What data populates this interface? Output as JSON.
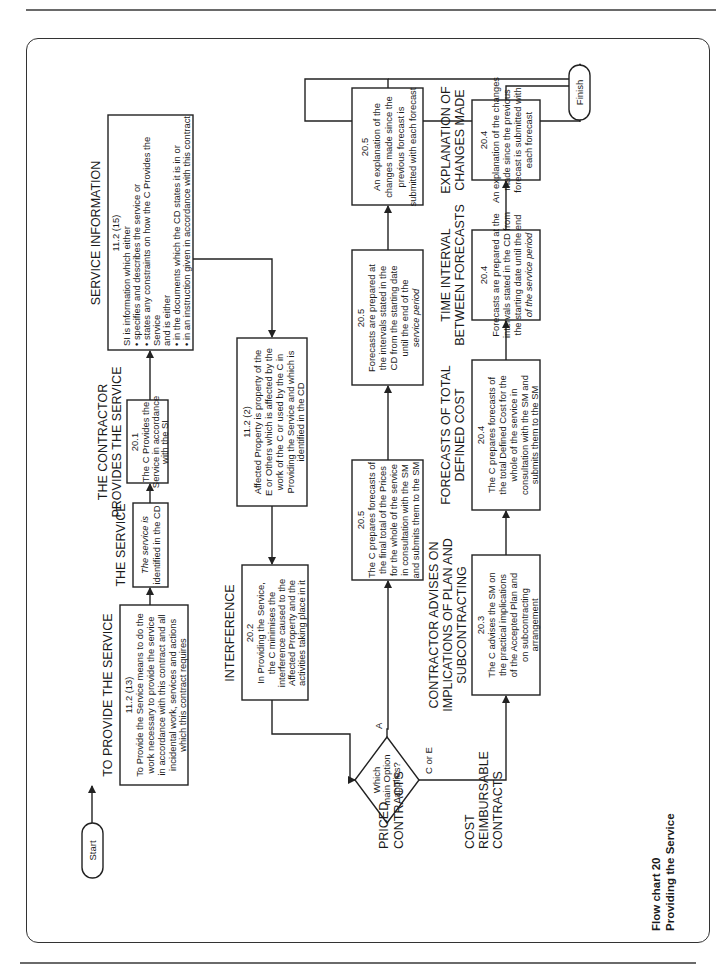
{
  "page": {
    "caption_line1": "Flow chart 20",
    "caption_line2": "Providing the Service"
  },
  "terminals": {
    "start": "Start",
    "finish": "Finish"
  },
  "sections": {
    "provide": "TO PROVIDE THE SERVICE",
    "service": "THE SERVICE",
    "contractor_line1": "THE CONTRACTOR",
    "contractor_line2": "PROVIDES THE SERVICE",
    "service_information": "SERVICE INFORMATION",
    "interference": "INTERFERENCE",
    "advises_line1": "CONTRACTOR ADVISES ON",
    "advises_line2": "IMPLICATIONS OF PLAN AND",
    "advises_line3": "SUBCONTRACTING",
    "forecasts_line1": "FORECASTS OF TOTAL",
    "forecasts_line2": "DEFINED COST",
    "interval_line1": "TIME INTERVAL",
    "interval_line2": "BETWEEN FORECASTS",
    "explanation_line1": "EXPLANATION OF",
    "explanation_line2": "CHANGES MADE",
    "priced_line1": "PRICED",
    "priced_line2": "CONTRACTS",
    "cost_line1": "COST",
    "cost_line2": "REIMBURSABLE",
    "cost_line3": "CONTRACTS"
  },
  "boxes": {
    "provide": {
      "ref": "11.2 (13)",
      "lines": [
        "To Provide the Service means to do the",
        "work necessary to provide the service",
        "in accordance with this contract and all",
        "incidental work, services and actions",
        "which this contract requires"
      ]
    },
    "service": {
      "lines": [
        "The service is",
        "identified in the CD"
      ]
    },
    "contractor": {
      "ref": "20.1",
      "lines": [
        "The C Provides the",
        "Service in accordance",
        "with the SI"
      ]
    },
    "service_information": {
      "ref": "11.2 (15)",
      "lines": [
        "SI is information which either",
        "• specifies and describes the service or",
        "• states any constraints on how the C Provides the",
        "   Service",
        "and is either",
        "• in the documents which the CD states it is in or",
        "• in an instruction given in accordance with this contract"
      ]
    },
    "affected_property": {
      "ref": "11.2 (2)",
      "lines": [
        "Affected Property is property of the",
        "E or Others which is affected by the",
        "work of the C or used by the C in",
        "Providing the Service and which is",
        "identified in the CD"
      ]
    },
    "interference": {
      "ref": "20.2",
      "lines": [
        "In Providing the Service,",
        "the C minimises the",
        "interference caused to the",
        "Affected Property and the",
        "activities taking place in it"
      ]
    },
    "priced_forecast": {
      "ref": "20.5",
      "lines": [
        "The C prepares forecasts of",
        "the final total of the Prices",
        "for the whole of the service",
        "in consultation with the SM",
        "and submits them to the SM"
      ]
    },
    "priced_interval": {
      "ref": "20.5",
      "lines": [
        "Forecasts are prepared at",
        "the intervals stated in the",
        "CD from the starting date",
        "until the end of the",
        "service period"
      ]
    },
    "priced_explanation": {
      "ref": "20.5",
      "lines": [
        "An explanation of the",
        "changes made since the",
        "previous forecast is",
        "submitted with each forecast"
      ]
    },
    "advises": {
      "ref": "20.3",
      "lines": [
        "The C advises the SM on",
        "the practical implications",
        "of the Accepted Plan and",
        "on subcontracting",
        "arrangement"
      ]
    },
    "cost_forecast": {
      "ref": "20.4",
      "lines": [
        "The C prepares forecasts of",
        "the total Defined Cost for the",
        "whole of the service in",
        "consultation with the SM and",
        "submits them to the SM"
      ]
    },
    "cost_interval": {
      "ref": "20.4",
      "lines": [
        "Forecasts are prepared at the",
        "intervals stated in the CD from",
        "the starting date until the end",
        "of the service period"
      ]
    },
    "cost_explanation": {
      "ref": "20.4",
      "lines": [
        "An explanation of the changes",
        "made since the previous",
        "forecast is submitted with",
        "each forecast"
      ]
    }
  },
  "decision": {
    "line1": "Which",
    "line2": "main Option",
    "line3": "applies?",
    "branch_a": "A",
    "branch_ce": "C or E"
  }
}
